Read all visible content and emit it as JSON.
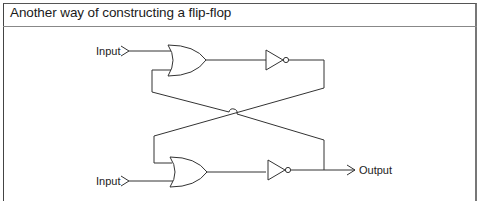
{
  "figure": {
    "title": "Another way of constructing a flip-flop"
  },
  "diagram": {
    "labels": {
      "input_top": "Input",
      "input_bottom": "Input",
      "output": "Output"
    },
    "gates": [
      {
        "type": "OR",
        "position": "top"
      },
      {
        "type": "NOT",
        "position": "top"
      },
      {
        "type": "OR",
        "position": "bottom"
      },
      {
        "type": "NOT",
        "position": "bottom"
      }
    ],
    "line_color": "#333333"
  }
}
